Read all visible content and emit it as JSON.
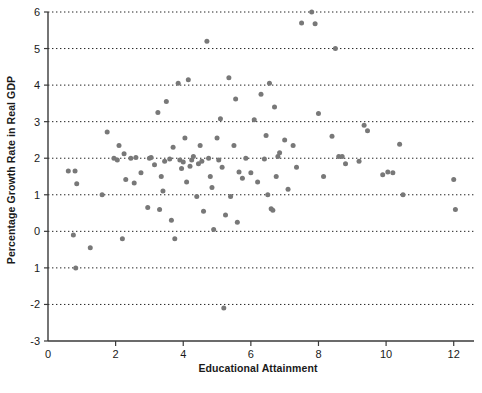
{
  "chart_data": {
    "type": "scatter",
    "title": "",
    "xlabel": "Educational Attainment",
    "ylabel": "Percentage Growth Rate in Real GDP",
    "xlim": [
      0,
      12.6
    ],
    "ylim": [
      -3,
      6
    ],
    "xticks": [
      0,
      2,
      4,
      6,
      8,
      10,
      12
    ],
    "xtick_labels": [
      "0",
      "2",
      "4",
      "6",
      "8",
      "10",
      "12"
    ],
    "yticks": [
      -3,
      -2,
      -1,
      0,
      1,
      2,
      3,
      4,
      5,
      6
    ],
    "ytick_labels": [
      "-3",
      "-2",
      "1",
      "0",
      "1",
      "2",
      "3",
      "4",
      "5",
      "6"
    ],
    "grid": true,
    "grid_axis": "y",
    "grid_style": "dotted",
    "legend": false,
    "marker": "circle",
    "marker_color": "#787878",
    "marker_size": 5,
    "points": [
      [
        0.6,
        1.65
      ],
      [
        0.75,
        -0.1
      ],
      [
        0.8,
        1.65
      ],
      [
        0.82,
        -1.0
      ],
      [
        0.85,
        1.3
      ],
      [
        1.25,
        -0.45
      ],
      [
        1.6,
        1.0
      ],
      [
        1.75,
        2.72
      ],
      [
        1.95,
        2.0
      ],
      [
        2.05,
        1.95
      ],
      [
        2.1,
        2.35
      ],
      [
        2.2,
        -0.2
      ],
      [
        2.25,
        2.12
      ],
      [
        2.3,
        1.42
      ],
      [
        2.45,
        2.0
      ],
      [
        2.55,
        1.32
      ],
      [
        2.6,
        2.02
      ],
      [
        2.75,
        1.6
      ],
      [
        2.95,
        0.65
      ],
      [
        3.0,
        2.0
      ],
      [
        3.05,
        2.02
      ],
      [
        3.15,
        1.82
      ],
      [
        3.25,
        3.25
      ],
      [
        3.3,
        0.6
      ],
      [
        3.35,
        1.5
      ],
      [
        3.4,
        1.1
      ],
      [
        3.45,
        1.92
      ],
      [
        3.5,
        3.55
      ],
      [
        3.6,
        1.98
      ],
      [
        3.65,
        0.3
      ],
      [
        3.7,
        2.3
      ],
      [
        3.75,
        -0.2
      ],
      [
        3.85,
        4.05
      ],
      [
        3.9,
        1.95
      ],
      [
        3.95,
        1.72
      ],
      [
        4.0,
        1.9
      ],
      [
        4.05,
        2.55
      ],
      [
        4.1,
        1.35
      ],
      [
        4.15,
        4.15
      ],
      [
        4.2,
        1.78
      ],
      [
        4.25,
        1.95
      ],
      [
        4.3,
        2.05
      ],
      [
        4.4,
        0.95
      ],
      [
        4.45,
        1.85
      ],
      [
        4.5,
        2.35
      ],
      [
        4.55,
        1.92
      ],
      [
        4.6,
        0.55
      ],
      [
        4.7,
        5.2
      ],
      [
        4.75,
        2.0
      ],
      [
        4.8,
        1.5
      ],
      [
        4.85,
        1.2
      ],
      [
        4.9,
        0.05
      ],
      [
        5.0,
        2.55
      ],
      [
        5.05,
        1.95
      ],
      [
        5.1,
        3.08
      ],
      [
        5.15,
        1.75
      ],
      [
        5.2,
        -2.1
      ],
      [
        5.25,
        0.45
      ],
      [
        5.35,
        4.2
      ],
      [
        5.4,
        0.95
      ],
      [
        5.5,
        2.35
      ],
      [
        5.55,
        3.62
      ],
      [
        5.6,
        0.25
      ],
      [
        5.65,
        1.62
      ],
      [
        5.75,
        1.45
      ],
      [
        5.85,
        2.0
      ],
      [
        6.0,
        1.6
      ],
      [
        6.1,
        3.05
      ],
      [
        6.2,
        1.35
      ],
      [
        6.3,
        3.75
      ],
      [
        6.4,
        1.98
      ],
      [
        6.45,
        2.62
      ],
      [
        6.5,
        1.0
      ],
      [
        6.55,
        4.05
      ],
      [
        6.6,
        0.62
      ],
      [
        6.65,
        0.58
      ],
      [
        6.7,
        3.4
      ],
      [
        6.75,
        1.5
      ],
      [
        6.8,
        2.05
      ],
      [
        6.85,
        2.15
      ],
      [
        7.0,
        2.5
      ],
      [
        7.1,
        1.15
      ],
      [
        7.25,
        2.35
      ],
      [
        7.35,
        1.75
      ],
      [
        7.5,
        5.7
      ],
      [
        7.8,
        6.0
      ],
      [
        7.9,
        5.68
      ],
      [
        8.0,
        3.22
      ],
      [
        8.15,
        1.5
      ],
      [
        8.4,
        2.6
      ],
      [
        8.5,
        5.0
      ],
      [
        8.6,
        2.05
      ],
      [
        8.7,
        2.05
      ],
      [
        8.8,
        1.85
      ],
      [
        9.2,
        1.92
      ],
      [
        9.35,
        2.9
      ],
      [
        9.45,
        2.75
      ],
      [
        9.9,
        1.55
      ],
      [
        10.05,
        1.62
      ],
      [
        10.2,
        1.6
      ],
      [
        10.4,
        2.38
      ],
      [
        10.5,
        1.0
      ],
      [
        12.0,
        1.42
      ],
      [
        12.05,
        0.6
      ]
    ]
  }
}
